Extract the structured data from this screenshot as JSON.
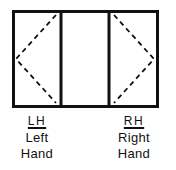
{
  "diagram": {
    "frame": {
      "x": 13,
      "y": 11,
      "width": 145,
      "height": 96,
      "stroke": "#111111",
      "stroke_width": 3
    },
    "dividers": [
      61,
      109
    ],
    "panels": [
      {
        "name": "left-sash",
        "type": "casement",
        "hinge": "left",
        "apex": "left",
        "dashed": true
      },
      {
        "name": "center-fixed",
        "type": "fixed"
      },
      {
        "name": "right-sash",
        "type": "casement",
        "hinge": "right",
        "apex": "right",
        "dashed": true
      }
    ],
    "colors": {
      "line": "#111111",
      "background": "#ffffff"
    }
  },
  "labels": {
    "left": {
      "abbr": "LH",
      "line1": "Left",
      "line2": "Hand"
    },
    "right": {
      "abbr": "RH",
      "line1": "Right",
      "line2": "Hand"
    }
  }
}
